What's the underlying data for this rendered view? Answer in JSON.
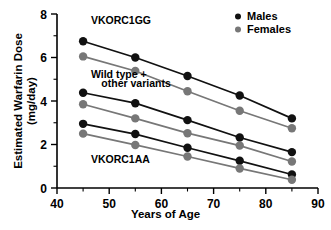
{
  "chart_data": {
    "type": "line",
    "title": "",
    "xlabel": "Years of Age",
    "ylabel_line1": "Estimated Warfarin Dose",
    "ylabel_line2": "(mg/day)",
    "x": [
      45,
      55,
      65,
      75,
      85
    ],
    "xlim": [
      40,
      90
    ],
    "ylim": [
      0,
      8
    ],
    "xticks": [
      40,
      50,
      60,
      70,
      80,
      90
    ],
    "xtick_labels": [
      "40",
      "50",
      "60",
      "70",
      "80",
      "90"
    ],
    "xminor_ticks": [
      45,
      55,
      65,
      75,
      85
    ],
    "yticks": [
      0,
      2,
      4,
      6,
      8
    ],
    "ytick_labels": [
      "0",
      "2",
      "4",
      "6",
      "8"
    ],
    "yminor_ticks": [
      1,
      3,
      5,
      7
    ],
    "grid": false,
    "legend_position": "top-right",
    "legend": [
      {
        "name": "Males",
        "color": "#111111"
      },
      {
        "name": "Females",
        "color": "#777777"
      }
    ],
    "annotations": [
      {
        "text": "VKORC1GG",
        "x": 46.5,
        "y": 7.55
      },
      {
        "text": "Wild type +",
        "x": 46.5,
        "y": 5.05
      },
      {
        "text": "other variants",
        "x": 48.5,
        "y": 4.65
      },
      {
        "text": "VKORC1AA",
        "x": 46.5,
        "y": 1.15
      }
    ],
    "series": [
      {
        "name": "VKORC1GG Males",
        "group": "VKORC1GG",
        "sex": "Males",
        "color": "#111111",
        "values": [
          6.75,
          6.0,
          5.15,
          4.25,
          3.2
        ]
      },
      {
        "name": "VKORC1GG Females",
        "group": "VKORC1GG",
        "sex": "Females",
        "color": "#777777",
        "values": [
          6.05,
          5.38,
          4.45,
          3.55,
          2.75
        ]
      },
      {
        "name": "Wild type + other variants Males",
        "group": "Wild type + other variants",
        "sex": "Males",
        "color": "#111111",
        "values": [
          4.38,
          3.9,
          3.12,
          2.32,
          1.65
        ]
      },
      {
        "name": "Wild type + other variants Females",
        "group": "Wild type + other variants",
        "sex": "Females",
        "color": "#777777",
        "values": [
          3.85,
          3.2,
          2.52,
          1.95,
          1.22
        ]
      },
      {
        "name": "VKORC1AA Males",
        "group": "VKORC1AA",
        "sex": "Males",
        "color": "#111111",
        "values": [
          2.95,
          2.48,
          1.85,
          1.25,
          0.62
        ]
      },
      {
        "name": "VKORC1AA Females",
        "group": "VKORC1AA",
        "sex": "Females",
        "color": "#777777",
        "values": [
          2.5,
          1.98,
          1.45,
          0.9,
          0.38
        ]
      }
    ]
  }
}
